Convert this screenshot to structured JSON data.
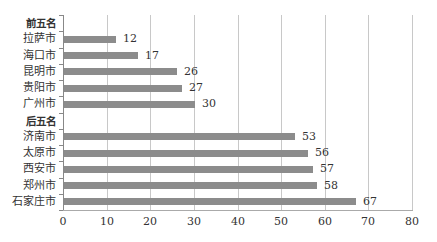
{
  "chart_data": {
    "type": "bar",
    "orientation": "horizontal",
    "title": "",
    "xlabel": "",
    "ylabel": "",
    "xlim": [
      0,
      80
    ],
    "x_ticks": [
      "0",
      "10",
      "20",
      "30",
      "40",
      "50",
      "60",
      "70",
      "80"
    ],
    "grid": "vertical",
    "legend": null,
    "bar_color": "#8c8c8c",
    "groups": [
      {
        "header": "前五名",
        "categories": [
          "拉萨市",
          "海口市",
          "昆明市",
          "贵阳市",
          "广州市"
        ],
        "values": [
          12,
          17,
          26,
          27,
          30
        ]
      },
      {
        "header": "后五名",
        "categories": [
          "济南市",
          "太原市",
          "西安市",
          "郑州市",
          "石家庄市"
        ],
        "values": [
          53,
          56,
          57,
          58,
          67
        ]
      }
    ],
    "rows": [
      {
        "label": "前五名",
        "header": true
      },
      {
        "label": "拉萨市",
        "value": 12,
        "value_label": "12"
      },
      {
        "label": "海口市",
        "value": 17,
        "value_label": "17"
      },
      {
        "label": "昆明市",
        "value": 26,
        "value_label": "26"
      },
      {
        "label": "贵阳市",
        "value": 27,
        "value_label": "27"
      },
      {
        "label": "广州市",
        "value": 30,
        "value_label": "30"
      },
      {
        "label": "后五名",
        "header": true
      },
      {
        "label": "济南市",
        "value": 53,
        "value_label": "53"
      },
      {
        "label": "太原市",
        "value": 56,
        "value_label": "56"
      },
      {
        "label": "西安市",
        "value": 57,
        "value_label": "57"
      },
      {
        "label": "郑州市",
        "value": 58,
        "value_label": "58"
      },
      {
        "label": "石家庄市",
        "value": 67,
        "value_label": "67"
      }
    ]
  }
}
